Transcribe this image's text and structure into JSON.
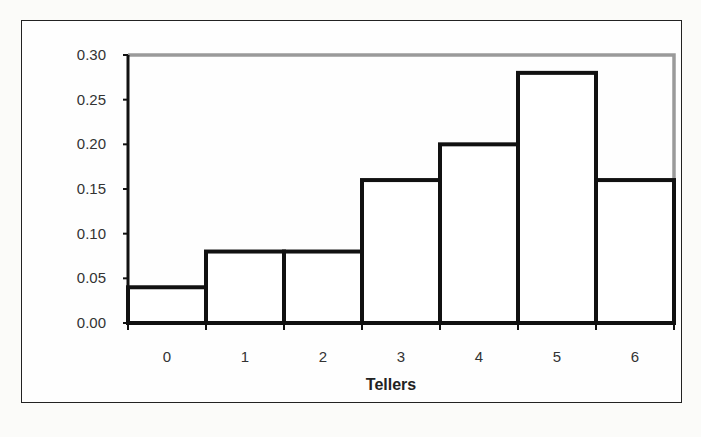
{
  "chart_data": {
    "type": "bar",
    "title": "",
    "xlabel": "Tellers",
    "ylabel": "",
    "categories": [
      "0",
      "1",
      "2",
      "3",
      "4",
      "5",
      "6"
    ],
    "values": [
      0.04,
      0.08,
      0.08,
      0.16,
      0.2,
      0.28,
      0.16
    ],
    "ylim": [
      0,
      0.3
    ],
    "yticks": [
      "0.00",
      "0.05",
      "0.10",
      "0.15",
      "0.20",
      "0.25",
      "0.30"
    ],
    "grid": false,
    "legend": null,
    "bar_style": "histogram, white fill, thick black outline, no gaps"
  },
  "colors": {
    "bar_fill": "#ffffff",
    "bar_stroke": "#111111",
    "plot_border": "#999999",
    "frame_border": "#222222",
    "text": "#333333"
  }
}
